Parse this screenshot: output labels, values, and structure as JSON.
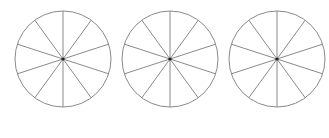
{
  "diagram": {
    "type": "fraction-circles",
    "stroke_color": "#8a8a8a",
    "center_dot_color": "#222222",
    "background": "#ffffff",
    "circles": [
      {
        "cx": 63,
        "cy": 59,
        "r": 48,
        "slices": 10,
        "shaded": 0
      },
      {
        "cx": 170,
        "cy": 59,
        "r": 48,
        "slices": 10,
        "shaded": 0
      },
      {
        "cx": 277,
        "cy": 59,
        "r": 48,
        "slices": 10,
        "shaded": 0
      }
    ]
  }
}
